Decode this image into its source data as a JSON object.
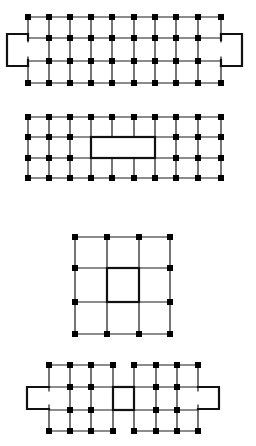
{
  "colors": {
    "line": "#1a1a1a",
    "bold": "#111111",
    "node": "#000000",
    "background": "#ffffff"
  },
  "diagrams": [
    {
      "id": "grid-1",
      "description": "10x4 node grid with bracket loops on left and right ends",
      "cols_x": [
        28,
        49,
        70,
        91,
        112,
        134,
        155,
        176,
        198,
        221
      ],
      "rows_y": [
        17,
        38,
        61,
        83
      ],
      "left_bracket_x": 7,
      "right_bracket_x": 242
    },
    {
      "id": "grid-2",
      "description": "10x4 node grid with bold central rectangle spanning columns 4-7, rows 2-3",
      "cols_x": [
        28,
        49,
        70,
        91,
        112,
        134,
        155,
        176,
        198,
        221
      ],
      "rows_y": [
        117,
        137,
        158,
        178
      ],
      "rect_cols": [
        4,
        7
      ],
      "rect_rows": [
        2,
        3
      ]
    },
    {
      "id": "grid-3",
      "description": "4x4 node grid with bold central square, nodes on perimeter only",
      "cols_x": [
        75,
        107,
        139,
        170
      ],
      "rows_y": [
        237,
        268,
        302,
        334
      ]
    },
    {
      "id": "grid-4",
      "description": "two 4x4 grids joined by a bold central square, bracket loops on both ends",
      "cols_x": [
        49,
        70,
        91,
        113,
        134,
        156,
        177,
        198
      ],
      "rows_y": [
        365,
        387,
        410,
        431
      ],
      "left_bracket_x": 27,
      "right_bracket_x": 219
    }
  ]
}
